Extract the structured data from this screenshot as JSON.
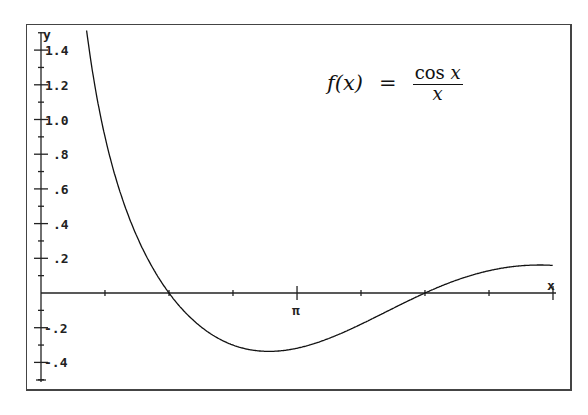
{
  "chart_data": {
    "type": "line",
    "formula": {
      "lhs": "f(x)",
      "eq": "=",
      "numerator_fn": "cos",
      "numerator_var": "x",
      "denominator": "x"
    },
    "xlabel": "x",
    "ylabel": "y",
    "x_tick_labels": [
      {
        "value": 3.14159,
        "label": "π"
      }
    ],
    "x_minor_ticks": [
      0.785,
      1.571,
      2.356,
      3.142,
      3.927,
      4.712,
      5.498,
      6.283
    ],
    "y_tick_labels": [
      "1.4",
      "1.2",
      "1.0",
      ".8",
      ".6",
      ".4",
      ".2",
      "-.2",
      "-.4"
    ],
    "y_tick_values": [
      1.4,
      1.2,
      1.0,
      0.8,
      0.6,
      0.4,
      0.2,
      -0.2,
      -0.4
    ],
    "xlim": [
      0,
      6.283
    ],
    "ylim": [
      -0.5,
      1.5
    ],
    "grid": false,
    "series": [
      {
        "name": "cos(x)/x",
        "x": [
          0.57,
          0.8,
          1.0,
          1.2,
          1.571,
          2.0,
          2.5,
          2.8,
          3.14,
          3.5,
          4.0,
          4.712,
          5.0,
          5.5,
          6.0,
          6.283
        ],
        "values": [
          1.48,
          0.87,
          0.54,
          0.3,
          0.0,
          -0.21,
          -0.32,
          -0.34,
          -0.32,
          -0.27,
          -0.16,
          0.0,
          0.06,
          0.13,
          0.16,
          0.16
        ]
      }
    ]
  },
  "labels": {
    "y_axis": "y",
    "x_axis": "x",
    "pi": "π",
    "y_ticks": [
      "1.4",
      "1.2",
      "1.0",
      ".8",
      ".6",
      ".4",
      ".2",
      "-.2",
      "-.4"
    ]
  },
  "formula": {
    "lhs": "f(x)",
    "eq": "=",
    "num": "cos",
    "num_var": "x",
    "den": "x"
  }
}
